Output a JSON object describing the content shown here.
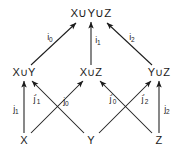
{
  "diagram": {
    "background_color": "#ffffff",
    "stroke_color": "#1c1c1c",
    "nodes": [
      {
        "id": "top",
        "label": "X∪Y∪Z",
        "x": 91,
        "y": 13
      },
      {
        "id": "xy",
        "label": "X∪Y",
        "x": 24,
        "y": 72
      },
      {
        "id": "xz",
        "label": "X∪Z",
        "x": 91,
        "y": 72
      },
      {
        "id": "yz",
        "label": "Y∪Z",
        "x": 159,
        "y": 72
      },
      {
        "id": "x",
        "label": "X",
        "x": 24,
        "y": 140
      },
      {
        "id": "y",
        "label": "Y",
        "x": 91,
        "y": 140
      },
      {
        "id": "z",
        "label": "Z",
        "x": 159,
        "y": 140
      }
    ],
    "edges": [
      {
        "id": "i0",
        "from": "xy",
        "to": "top",
        "base": "i",
        "subscript": "0",
        "prime": "",
        "label_x": 50,
        "label_y": 37
      },
      {
        "id": "i1",
        "from": "xz",
        "to": "top",
        "base": "i",
        "subscript": "1",
        "prime": "",
        "label_x": 98,
        "label_y": 40
      },
      {
        "id": "i2",
        "from": "yz",
        "to": "top",
        "base": "i",
        "subscript": "2",
        "prime": "",
        "label_x": 132,
        "label_y": 37
      },
      {
        "id": "j1",
        "from": "x",
        "to": "xy",
        "base": "j",
        "subscript": "1",
        "prime": "",
        "label_x": 16,
        "label_y": 109
      },
      {
        "id": "j1p",
        "from": "y",
        "to": "xy",
        "base": "j",
        "subscript": "1",
        "prime": "′",
        "label_x": 37,
        "label_y": 99
      },
      {
        "id": "j0",
        "from": "x",
        "to": "xz",
        "base": "j",
        "subscript": "0",
        "prime": "",
        "label_x": 66,
        "label_y": 101
      },
      {
        "id": "j0p",
        "from": "z",
        "to": "xz",
        "base": "j",
        "subscript": "0",
        "prime": "′",
        "label_x": 113,
        "label_y": 99
      },
      {
        "id": "j2p",
        "from": "y",
        "to": "yz",
        "base": "j",
        "subscript": "2",
        "prime": "′",
        "label_x": 145,
        "label_y": 99
      },
      {
        "id": "j2",
        "from": "z",
        "to": "yz",
        "base": "j",
        "subscript": "2",
        "prime": "",
        "label_x": 167,
        "label_y": 109
      }
    ]
  }
}
